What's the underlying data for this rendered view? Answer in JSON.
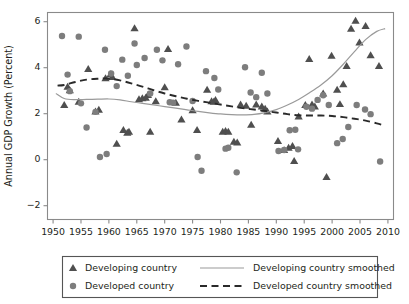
{
  "chart_data": {
    "type": "scatter",
    "title": "",
    "xlabel": "",
    "ylabel": "Annual GDP Growth (Percent)",
    "xlim": [
      1949,
      2011
    ],
    "ylim": [
      -2.6,
      6.4
    ],
    "xticks": [
      1950,
      1955,
      1960,
      1965,
      1970,
      1975,
      1980,
      1985,
      1990,
      1995,
      2000,
      2005,
      2010
    ],
    "yticks": [
      -2,
      0,
      2,
      4,
      6
    ],
    "ytick_labels": [
      "−2",
      "0",
      "2",
      "4",
      "6"
    ],
    "grid": false,
    "legend_position": "below",
    "series": [
      {
        "name": "Developing country",
        "marker": "triangle",
        "color": "#4f4f4f",
        "points": [
          [
            1952,
            2.38
          ],
          [
            1952.6,
            3.18
          ],
          [
            1953,
            3.02
          ],
          [
            1954.6,
            2.52
          ],
          [
            1956.3,
            3.95
          ],
          [
            1957.6,
            2.1
          ],
          [
            1958.2,
            2.18
          ],
          [
            1959.4,
            3.55
          ],
          [
            1960.3,
            3.72
          ],
          [
            1960.6,
            3.6
          ],
          [
            1961.4,
            0.7
          ],
          [
            1962.6,
            1.3
          ],
          [
            1963.3,
            1.18
          ],
          [
            1963.6,
            1.22
          ],
          [
            1964.6,
            5.72
          ],
          [
            1965.4,
            2.63
          ],
          [
            1966.0,
            2.68
          ],
          [
            1966.6,
            2.7
          ],
          [
            1967.0,
            2.82
          ],
          [
            1967.4,
            1.22
          ],
          [
            1968.4,
            2.55
          ],
          [
            1970.0,
            3.15
          ],
          [
            1970.6,
            4.82
          ],
          [
            1972.0,
            2.48
          ],
          [
            1973.0,
            1.75
          ],
          [
            1975.0,
            2.15
          ],
          [
            1975.8,
            1.3
          ],
          [
            1977.6,
            3.05
          ],
          [
            1978.4,
            2.55
          ],
          [
            1978.8,
            2.52
          ],
          [
            1979.1,
            2.6
          ],
          [
            1980.4,
            1.22
          ],
          [
            1980.9,
            1.25
          ],
          [
            1981.4,
            1.22
          ],
          [
            1982.4,
            0.78
          ],
          [
            1983.0,
            0.75
          ],
          [
            1983.6,
            2.4
          ],
          [
            1984.6,
            2.35
          ],
          [
            1985.5,
            1.52
          ],
          [
            1986.4,
            2.4
          ],
          [
            1987.4,
            2.32
          ],
          [
            1988.0,
            2.22
          ],
          [
            1988.4,
            2.1
          ],
          [
            1990.3,
            0.82
          ],
          [
            1991.4,
            0.42
          ],
          [
            1992.2,
            0.52
          ],
          [
            1992.9,
            0.6
          ],
          [
            1993.2,
            -0.05
          ],
          [
            1994.0,
            1.88
          ],
          [
            1995.2,
            2.38
          ],
          [
            1995.9,
            4.38
          ],
          [
            1996.4,
            2.4
          ],
          [
            1996.9,
            2.32
          ],
          [
            1998.4,
            2.88
          ],
          [
            1999.0,
            -0.75
          ],
          [
            1999.9,
            4.52
          ],
          [
            2000.9,
            3.05
          ],
          [
            2001.4,
            2.42
          ],
          [
            2002.0,
            3.28
          ],
          [
            2002.6,
            4.08
          ],
          [
            2003.4,
            5.7
          ],
          [
            2004.2,
            6.05
          ],
          [
            2004.9,
            5.1
          ],
          [
            2006.0,
            5.82
          ],
          [
            2006.9,
            4.55
          ],
          [
            2008.4,
            4.08
          ]
        ]
      },
      {
        "name": "Developed country",
        "marker": "circle",
        "color": "#7d7d7d",
        "points": [
          [
            1951.6,
            5.38
          ],
          [
            1952.6,
            3.7
          ],
          [
            1953.0,
            2.98
          ],
          [
            1954.6,
            5.35
          ],
          [
            1955.0,
            2.45
          ],
          [
            1956.0,
            1.4
          ],
          [
            1957.6,
            2.08
          ],
          [
            1958.4,
            0.12
          ],
          [
            1959.3,
            4.78
          ],
          [
            1959.6,
            0.25
          ],
          [
            1960.4,
            3.75
          ],
          [
            1961.4,
            3.2
          ],
          [
            1962.4,
            4.35
          ],
          [
            1963.4,
            3.65
          ],
          [
            1964.6,
            5.05
          ],
          [
            1965.0,
            4.12
          ],
          [
            1966.4,
            4.42
          ],
          [
            1967.4,
            2.88
          ],
          [
            1968.6,
            4.78
          ],
          [
            1969.6,
            4.32
          ],
          [
            1970.9,
            2.5
          ],
          [
            1971.5,
            2.48
          ],
          [
            1972.4,
            4.15
          ],
          [
            1973.9,
            4.92
          ],
          [
            1975.0,
            2.55
          ],
          [
            1975.9,
            0.12
          ],
          [
            1976.6,
            -0.48
          ],
          [
            1977.4,
            3.85
          ],
          [
            1978.9,
            3.55
          ],
          [
            1979.6,
            3.05
          ],
          [
            1980.9,
            0.48
          ],
          [
            1981.4,
            0.52
          ],
          [
            1982.9,
            -0.55
          ],
          [
            1984.4,
            4.02
          ],
          [
            1985.4,
            2.92
          ],
          [
            1986.4,
            2.72
          ],
          [
            1987.4,
            3.78
          ],
          [
            1988.4,
            2.88
          ],
          [
            1990.4,
            0.38
          ],
          [
            1991.4,
            0.42
          ],
          [
            1992.4,
            1.28
          ],
          [
            1993.4,
            1.3
          ],
          [
            1993.9,
            0.45
          ],
          [
            1995.4,
            2.3
          ],
          [
            1996.4,
            2.22
          ],
          [
            1997.4,
            2.6
          ],
          [
            1998.4,
            2.8
          ],
          [
            1999.4,
            2.38
          ],
          [
            2000.9,
            0.72
          ],
          [
            2001.9,
            0.9
          ],
          [
            2002.9,
            1.42
          ],
          [
            2004.4,
            2.38
          ],
          [
            2005.9,
            2.18
          ],
          [
            2006.9,
            1.98
          ],
          [
            2008.6,
            -0.08
          ]
        ]
      }
    ],
    "smoothed": [
      {
        "name": "Developing country smoothed",
        "style": "solid",
        "color": "#9a9a9a",
        "points": [
          [
            1950.5,
            2.88
          ],
          [
            1952,
            2.66
          ],
          [
            1954,
            2.61
          ],
          [
            1956,
            2.62
          ],
          [
            1958,
            2.63
          ],
          [
            1960,
            2.64
          ],
          [
            1962,
            2.6
          ],
          [
            1964,
            2.52
          ],
          [
            1966,
            2.45
          ],
          [
            1968,
            2.38
          ],
          [
            1970,
            2.31
          ],
          [
            1972,
            2.24
          ],
          [
            1974,
            2.17
          ],
          [
            1976,
            2.1
          ],
          [
            1978,
            2.04
          ],
          [
            1980,
            1.99
          ],
          [
            1982,
            1.96
          ],
          [
            1984,
            1.95
          ],
          [
            1986,
            1.97
          ],
          [
            1988,
            2.05
          ],
          [
            1990,
            2.18
          ],
          [
            1992,
            2.38
          ],
          [
            1994,
            2.62
          ],
          [
            1996,
            2.92
          ],
          [
            1998,
            3.25
          ],
          [
            2000,
            3.65
          ],
          [
            2002,
            4.15
          ],
          [
            2004,
            4.7
          ],
          [
            2006,
            5.22
          ],
          [
            2008,
            5.58
          ],
          [
            2009.5,
            5.7
          ]
        ]
      },
      {
        "name": "Developed country smoothed",
        "style": "dashed",
        "color": "#2a2a2a",
        "points": [
          [
            1950.8,
            3.22
          ],
          [
            1952,
            3.25
          ],
          [
            1954,
            3.38
          ],
          [
            1956,
            3.48
          ],
          [
            1958,
            3.52
          ],
          [
            1959.8,
            3.53
          ],
          [
            1962,
            3.45
          ],
          [
            1964,
            3.32
          ],
          [
            1966,
            3.18
          ],
          [
            1968,
            3.02
          ],
          [
            1970,
            2.88
          ],
          [
            1972,
            2.76
          ],
          [
            1974,
            2.65
          ],
          [
            1976,
            2.56
          ],
          [
            1978,
            2.48
          ],
          [
            1980,
            2.4
          ],
          [
            1982,
            2.32
          ],
          [
            1984,
            2.24
          ],
          [
            1986,
            2.18
          ],
          [
            1988,
            2.12
          ],
          [
            1990,
            2.05
          ],
          [
            1992,
            1.98
          ],
          [
            1994,
            1.93
          ],
          [
            1996,
            1.92
          ],
          [
            1998,
            1.92
          ],
          [
            2000,
            1.9
          ],
          [
            2002,
            1.85
          ],
          [
            2004,
            1.78
          ],
          [
            2006,
            1.7
          ],
          [
            2008,
            1.58
          ],
          [
            2009.2,
            1.5
          ]
        ]
      }
    ],
    "legend": [
      {
        "label": "Developing country",
        "kind": "marker",
        "marker": "triangle",
        "color": "#4f4f4f"
      },
      {
        "label": "Developing country smoothed",
        "kind": "line",
        "style": "solid",
        "color": "#9a9a9a"
      },
      {
        "label": "Developed country",
        "kind": "marker",
        "marker": "circle",
        "color": "#7d7d7d"
      },
      {
        "label": "Developed country smoothed",
        "kind": "line",
        "style": "dashed",
        "color": "#2a2a2a"
      }
    ]
  }
}
